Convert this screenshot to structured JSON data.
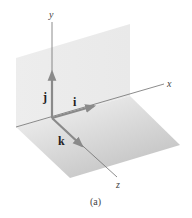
{
  "figure": {
    "caption": "(a)",
    "axes": {
      "x_label": "x",
      "y_label": "y",
      "z_label": "z"
    },
    "unit_vectors": {
      "i_label": "i",
      "j_label": "j",
      "k_label": "k"
    },
    "colors": {
      "axis_line": "#6e6e6e",
      "vector_arrow": "#8a8a8a",
      "vertical_plane": "#ececec",
      "floor_plane_light": "#f4f4f4",
      "floor_plane_dark": "#c4c4c4",
      "text": "#333333"
    }
  }
}
